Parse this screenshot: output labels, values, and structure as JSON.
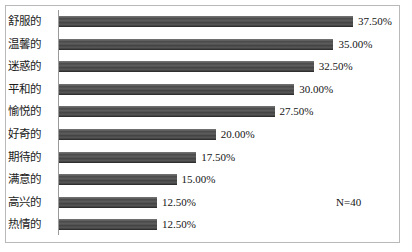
{
  "annotations": {
    "sample_size": "N=40",
    "sample_size_x": 330,
    "sample_size_y": 190
  },
  "style": {
    "bar_color": "#4a4a4a",
    "frame_border_color": "#b9b9b9",
    "axis_color": "#9a9a9a",
    "text_color": "#141414"
  },
  "chart_data": {
    "type": "bar",
    "orientation": "horizontal",
    "title": "",
    "subtitle": "",
    "xlabel": "",
    "ylabel": "",
    "xlim": [
      0,
      40
    ],
    "grid": false,
    "legend": false,
    "value_format": "percent",
    "value_suffix": "%",
    "annotation": "N=40",
    "categories": [
      "舒服的",
      "温馨的",
      "迷惑的",
      "平和的",
      "愉悦的",
      "好奇的",
      "期待的",
      "满意的",
      "高兴的",
      "热情的"
    ],
    "values": [
      37.5,
      35.0,
      32.5,
      30.0,
      27.5,
      20.0,
      17.5,
      15.0,
      12.5,
      12.5
    ],
    "value_labels": [
      "37.50%",
      "35.00%",
      "32.50%",
      "30.00%",
      "27.50%",
      "20.00%",
      "17.50%",
      "15.00%",
      "12.50%",
      "12.50%"
    ]
  }
}
